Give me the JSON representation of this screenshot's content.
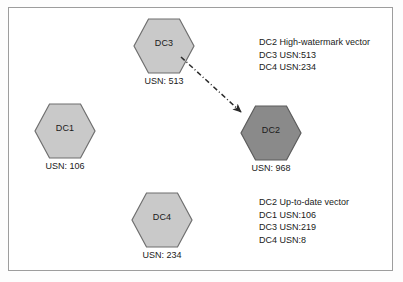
{
  "diagram": {
    "title_region": "active-directory-replication-usn-diagram",
    "border_color": "#9d9d9d",
    "background": "#ffffff",
    "node_fill": "#c9c9c9",
    "node_fill_highlight": "#8a8a8a",
    "node_stroke": "#6f6f6f",
    "text_color": "#1a1a1a",
    "arrow_color": "#2b2b2b"
  },
  "nodes": [
    {
      "id": "dc1",
      "label": "DC1",
      "usn": "USN: 106",
      "highlighted": false
    },
    {
      "id": "dc3",
      "label": "DC3",
      "usn": "USN: 513",
      "highlighted": false
    },
    {
      "id": "dc2",
      "label": "DC2",
      "usn": "USN: 968",
      "highlighted": true
    },
    {
      "id": "dc4",
      "label": "DC4",
      "usn": "USN: 234",
      "highlighted": false
    }
  ],
  "annotations": {
    "high_watermark": {
      "heading": "DC2 High-watermark vector",
      "lines": [
        "DC3 USN:513",
        "DC4 USN:234"
      ]
    },
    "up_to_date": {
      "heading": "DC2 Up-to-date vector",
      "lines": [
        "DC1 USN:106",
        "DC3 USN:219",
        "DC4 USN:8"
      ]
    }
  },
  "connector": {
    "from": "dc3",
    "to": "dc2",
    "style": "dash-dot-arrow"
  }
}
